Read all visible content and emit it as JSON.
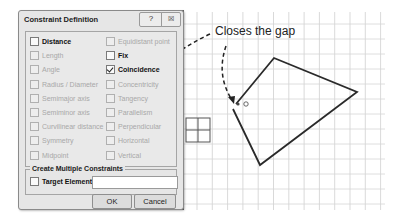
{
  "dialog": {
    "title": "Constraint Definition",
    "help_button": "?",
    "close_button": "☒",
    "constraints_left": [
      {
        "label": "Distance",
        "enabled": true,
        "checked": false
      },
      {
        "label": "Length",
        "enabled": false,
        "checked": false
      },
      {
        "label": "Angle",
        "enabled": false,
        "checked": false
      },
      {
        "label": "Radius / Diameter",
        "enabled": false,
        "checked": false
      },
      {
        "label": "Semimajor axis",
        "enabled": false,
        "checked": false
      },
      {
        "label": "Semiminor axis",
        "enabled": false,
        "checked": false
      },
      {
        "label": "Curvilinear distance",
        "enabled": false,
        "checked": false
      },
      {
        "label": "Symmetry",
        "enabled": false,
        "checked": false
      },
      {
        "label": "Midpoint",
        "enabled": false,
        "checked": false
      }
    ],
    "constraints_right": [
      {
        "label": "Equidistant point",
        "enabled": false,
        "checked": false
      },
      {
        "label": "Fix",
        "enabled": true,
        "checked": false
      },
      {
        "label": "Coincidence",
        "enabled": true,
        "checked": true
      },
      {
        "label": "Concentricity",
        "enabled": false,
        "checked": false
      },
      {
        "label": "Tangency",
        "enabled": false,
        "checked": false
      },
      {
        "label": "Parallelism",
        "enabled": false,
        "checked": false
      },
      {
        "label": "Perpendicular",
        "enabled": false,
        "checked": false
      },
      {
        "label": "Horizontal",
        "enabled": false,
        "checked": false
      },
      {
        "label": "Vertical",
        "enabled": false,
        "checked": false
      }
    ],
    "multiple_group": {
      "title": "Create Multiple Constraints",
      "target_label": "Target Element",
      "target_value": ""
    },
    "ok_label": "OK",
    "cancel_label": "Cancel"
  },
  "annotation": {
    "text": "Closes the gap"
  }
}
